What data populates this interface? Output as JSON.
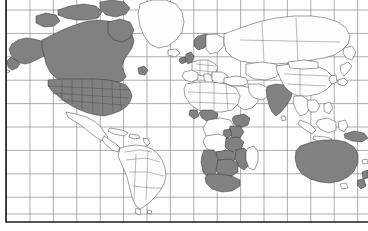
{
  "map": {
    "title": "World Map",
    "projection": "equirectangular",
    "width": 368,
    "height": 231,
    "background_color": "#ffffff",
    "ocean_color": "#ffffff",
    "graticule_color": "#8a8a8a",
    "frame_color": "#1a1a1a",
    "country_fill_color": "#fdfdfd",
    "country_border_color": "#2b2b2b",
    "highlight_fill_color": "#818181",
    "graticule": {
      "spacing_px_x": 23.4,
      "spacing_px_y": 23.4,
      "vertical_lines": 16,
      "horizontal_lines": 10,
      "visible": true
    },
    "frame": {
      "left_x": 6,
      "bottom_y": 222,
      "top_visible": false,
      "right_visible": false
    },
    "highlighted_regions": [
      "United States",
      "Canada",
      "United Kingdom",
      "Ireland",
      "Norway",
      "India",
      "Nigeria",
      "Ghana",
      "Kenya",
      "Tanzania",
      "Uganda",
      "Zambia",
      "Zimbabwe",
      "Botswana",
      "Namibia",
      "South Africa",
      "Mozambique",
      "Malawi",
      "Australia",
      "New Zealand",
      "Papua New Guinea"
    ],
    "unhighlighted_regions": [
      "Greenland",
      "Russia",
      "China",
      "Brazil",
      "Argentina",
      "Mexico",
      "Saudi Arabia",
      "Indonesia",
      "Japan"
    ],
    "legend": {
      "present": false,
      "highlighted_label": "",
      "base_label": ""
    },
    "labels": {
      "present": false
    }
  }
}
